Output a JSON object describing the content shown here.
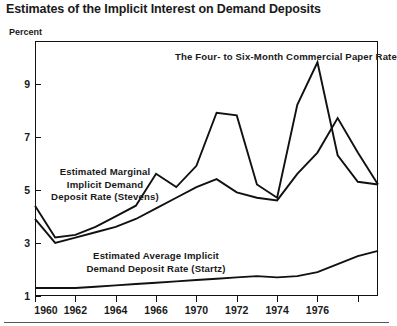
{
  "figure": {
    "title": "Estimates of the Implicit Interest on Demand Deposits",
    "unit_label": "Percent"
  },
  "annotations": {
    "commercial_paper": "The Four- to Six-Month Commercial Paper Rate",
    "stevens_line1": "Estimated Marginal",
    "stevens_line2": "Implicit Demand",
    "stevens_line3": "Deposit Rate (Stevens)",
    "startz_line1": "Estimated Average Implicit",
    "startz_line2": "Demand Deposit Rate (Startz)"
  },
  "chart_data": {
    "type": "line",
    "title": "Estimates of the Implicit Interest on Demand Deposits",
    "xlabel": "",
    "ylabel": "Percent",
    "xlim": [
      1960,
      1977
    ],
    "ylim": [
      1,
      10.6
    ],
    "grid": false,
    "legend_position": "inline-annotations",
    "yticks": [
      1,
      3,
      5,
      7,
      9
    ],
    "ytick_labels": [
      "1",
      "3",
      "5",
      "7",
      "9"
    ],
    "xticks": [
      1960,
      1962,
      1964,
      1966,
      1968,
      1970,
      1972,
      1974,
      1976
    ],
    "xtick_labels": [
      "1960",
      "1962",
      "1964",
      "1966",
      "1970",
      "1972",
      "1974",
      "1976"
    ],
    "x": [
      1960,
      1961,
      1962,
      1963,
      1964,
      1965,
      1966,
      1967,
      1968,
      1969,
      1970,
      1971,
      1972,
      1973,
      1974,
      1975,
      1976,
      1977
    ],
    "series": [
      {
        "name": "The Four- to Six-Month Commercial Paper Rate",
        "values": [
          4.4,
          3.2,
          3.3,
          3.6,
          4.0,
          4.4,
          5.6,
          5.1,
          5.9,
          7.9,
          7.8,
          5.2,
          4.7,
          8.2,
          9.8,
          6.3,
          5.3,
          5.2
        ]
      },
      {
        "name": "Estimated Marginal Implicit Demand Deposit Rate (Stevens)",
        "values": [
          3.9,
          3.0,
          3.2,
          3.4,
          3.6,
          3.9,
          4.3,
          4.7,
          5.1,
          5.4,
          4.9,
          4.7,
          4.6,
          5.6,
          6.4,
          7.7,
          6.4,
          5.2
        ]
      },
      {
        "name": "Estimated Average Implicit Demand Deposit Rate (Startz)",
        "values": [
          1.3,
          1.3,
          1.3,
          1.35,
          1.4,
          1.45,
          1.5,
          1.55,
          1.6,
          1.65,
          1.7,
          1.75,
          1.7,
          1.75,
          1.9,
          2.2,
          2.5,
          2.7
        ]
      }
    ]
  },
  "colors": {
    "line": "#111111",
    "axis": "#111111",
    "background": "#ffffff",
    "text": "#1a1a1a"
  }
}
